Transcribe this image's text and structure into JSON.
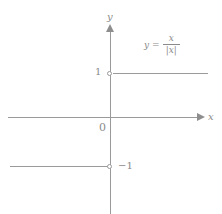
{
  "figure": {
    "axes": {
      "x_label": "x",
      "y_label": "y",
      "origin_label": "0"
    },
    "ticks": {
      "y_positive": "1",
      "y_negative": "−1"
    },
    "equation": {
      "lhs": "y",
      "relation": "=",
      "numerator": "x",
      "denominator": "|x|",
      "plain": "y = x/|x|"
    },
    "colors": {
      "line": "#9a9a9a",
      "text": "#8a8a8a",
      "background": "#ffffff"
    }
  },
  "chart_data": {
    "type": "line",
    "xlabel": "x",
    "ylabel": "y",
    "xlim": [
      -3.2,
      3.0
    ],
    "ylim": [
      -2.6,
      2.7
    ],
    "grid": false,
    "legend": null,
    "annotations": [
      "y = x/|x|"
    ],
    "xticks": [],
    "yticks": [
      -1,
      1
    ],
    "ytick_labels": [
      "−1",
      "1"
    ],
    "origin_label": "0",
    "series": [
      {
        "name": "x > 0 branch",
        "x": [
          0,
          3.0
        ],
        "values": [
          1,
          1
        ],
        "endpoint_open_at_x": 0
      },
      {
        "name": "x < 0 branch",
        "x": [
          -3.2,
          0
        ],
        "values": [
          -1,
          -1
        ],
        "endpoint_open_at_x": 0
      }
    ]
  }
}
